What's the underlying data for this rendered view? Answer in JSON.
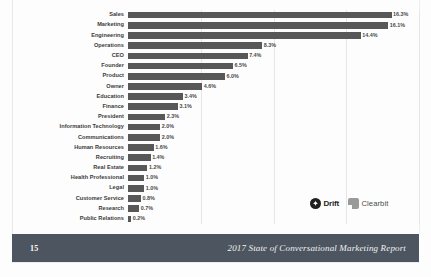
{
  "chart_data": {
    "type": "bar",
    "orientation": "horizontal",
    "title": "",
    "xlabel": "",
    "ylabel": "",
    "xlim": [
      0,
      18
    ],
    "grid": true,
    "gridlines_at": [
      4.5,
      9.0,
      13.5,
      18.0
    ],
    "legend": "none",
    "bar_color": "#585858",
    "categories": [
      "Sales",
      "Marketing",
      "Engineering",
      "Operations",
      "CEO",
      "Founder",
      "Product",
      "Owner",
      "Education",
      "Finance",
      "President",
      "Information Technology",
      "Communications",
      "Human Resources",
      "Recruiting",
      "Real Estate",
      "Health Professional",
      "Legal",
      "Customer Service",
      "Research",
      "Public Relations"
    ],
    "values": [
      16.3,
      16.1,
      14.4,
      8.3,
      7.4,
      6.5,
      6.0,
      4.6,
      3.4,
      3.1,
      2.3,
      2.0,
      2.0,
      1.6,
      1.4,
      1.2,
      1.0,
      1.0,
      0.8,
      0.7,
      0.2
    ],
    "value_labels": [
      "16.3%",
      "16.1%",
      "14.4%",
      "8.3%",
      "7.4%",
      "6.5%",
      "6.0%",
      "4.6%",
      "3.4%",
      "3.1%",
      "2.3%",
      "2.0%",
      "2.0%",
      "1.6%",
      "1.4%",
      "1.2%",
      "1.0%",
      "1.0%",
      "0.8%",
      "0.7%",
      "0.2%"
    ]
  },
  "logos": [
    {
      "name": "Drift",
      "label": "Drift",
      "mark": "drift-circle-icon",
      "color": "#1f1f1f"
    },
    {
      "name": "Clearbit",
      "label": "Clearbit",
      "mark": "clearbit-square-icon",
      "color": "#9a9a9a"
    }
  ],
  "footer": {
    "page_number": "15",
    "title": "2017 State of Conversational Marketing Report",
    "background": "#4c5560"
  }
}
